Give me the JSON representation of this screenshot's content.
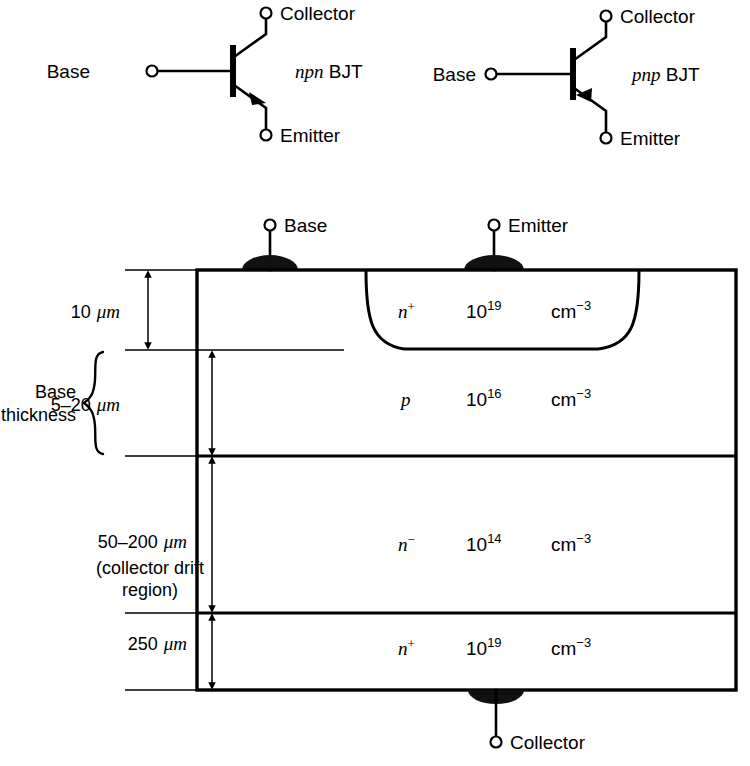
{
  "symbols": [
    {
      "id": "npn",
      "type_label_italic": "npn",
      "type_label_rest": " BJT",
      "base_label": "Base",
      "collector_label": "Collector",
      "emitter_label": "Emitter",
      "arrow_direction": "out"
    },
    {
      "id": "pnp",
      "type_label_italic": "pnp",
      "type_label_rest": " BJT",
      "base_label": "Base",
      "collector_label": "Collector",
      "emitter_label": "Emitter",
      "arrow_direction": "in"
    }
  ],
  "cross_section": {
    "top_terminals": [
      {
        "name": "base",
        "label": "Base"
      },
      {
        "name": "emitter",
        "label": "Emitter"
      }
    ],
    "bottom_terminal": {
      "name": "collector",
      "label": "Collector"
    },
    "layers": [
      {
        "id": "emitter-n-plus",
        "doping_type": "n",
        "doping_sign": "+",
        "concentration_mantissa": "10",
        "concentration_exponent": "19",
        "units_base": "cm",
        "units_exponent": "−3",
        "thickness_label": "10",
        "thickness_units": "μm"
      },
      {
        "id": "base-p",
        "doping_type": "p",
        "doping_sign": "",
        "concentration_mantissa": "10",
        "concentration_exponent": "16",
        "units_base": "cm",
        "units_exponent": "−3",
        "thickness_label": "5–20",
        "thickness_units": "μm"
      },
      {
        "id": "collector-drift-n-minus",
        "doping_type": "n",
        "doping_sign": "−",
        "concentration_mantissa": "10",
        "concentration_exponent": "14",
        "units_base": "cm",
        "units_exponent": "−3",
        "thickness_label": "50–200",
        "thickness_units": "μm"
      },
      {
        "id": "substrate-n-plus",
        "doping_type": "n",
        "doping_sign": "+",
        "concentration_mantissa": "10",
        "concentration_exponent": "19",
        "units_base": "cm",
        "units_exponent": "−3",
        "thickness_label": "250",
        "thickness_units": "μm"
      }
    ],
    "annotations": {
      "base_thickness_line1": "Base",
      "base_thickness_line2": "thickness",
      "drift_region_line1": "(collector drift",
      "drift_region_line2": "region)"
    }
  },
  "colors": {
    "ink": "#000000",
    "paper": "#ffffff",
    "contact_fill": "#111111"
  }
}
